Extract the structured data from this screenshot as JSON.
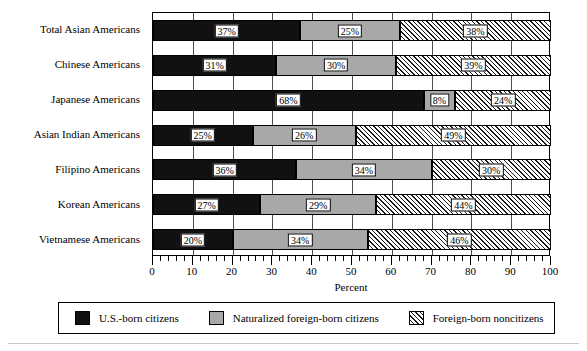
{
  "chart_data": {
    "type": "bar",
    "orientation": "horizontal",
    "stacked": true,
    "title": "",
    "xlabel": "Percent",
    "ylabel": "",
    "xlim": [
      0,
      100
    ],
    "xticks": [
      0,
      10,
      20,
      30,
      40,
      50,
      60,
      70,
      80,
      90,
      100
    ],
    "xticklabels": [
      "0",
      "10",
      "20",
      "30",
      "40",
      "50",
      "60",
      "70",
      "80",
      "90",
      "100"
    ],
    "minor_tick_interval": 2,
    "grid": "vertical",
    "legend_position": "bottom",
    "categories": [
      "Total Asian Americans",
      "Chinese Americans",
      "Japanese Americans",
      "Asian Indian Americans",
      "Filipino Americans",
      "Korean Americans",
      "Vietnamese Americans"
    ],
    "series": [
      {
        "name": "U.S.-born citizens",
        "pattern": "solid-black",
        "color": "#111111",
        "values": [
          37,
          31,
          68,
          25,
          36,
          27,
          20
        ],
        "labels": [
          "37%",
          "31%",
          "68%",
          "25%",
          "36%",
          "27%",
          "20%"
        ]
      },
      {
        "name": "Naturalized foreign-born citizens",
        "pattern": "solid-gray",
        "color": "#a8a8a8",
        "values": [
          25,
          30,
          8,
          26,
          34,
          29,
          34
        ],
        "labels": [
          "25%",
          "30%",
          "8%",
          "26%",
          "34%",
          "29%",
          "34%"
        ]
      },
      {
        "name": "Foreign-born noncitizens",
        "pattern": "diagonal-hatch",
        "color": "#ffffff",
        "values": [
          38,
          39,
          24,
          49,
          30,
          44,
          46
        ],
        "labels": [
          "38%",
          "39%",
          "24%",
          "49%",
          "30%",
          "44%",
          "46%"
        ]
      }
    ]
  },
  "axis": {
    "x_title": "Percent",
    "tick_labels": [
      "0",
      "10",
      "20",
      "30",
      "40",
      "50",
      "60",
      "70",
      "80",
      "90",
      "100"
    ],
    "category_labels": [
      "Total Asian Americans",
      "Chinese Americans",
      "Japanese Americans",
      "Asian Indian Americans",
      "Filipino Americans",
      "Korean Americans",
      "Vietnamese Americans"
    ]
  },
  "legend": {
    "items": [
      {
        "label": "U.S.-born citizens",
        "swatch": "solid-black-swatch"
      },
      {
        "label": "Naturalized foreign-born citizens",
        "swatch": "solid-gray-swatch"
      },
      {
        "label": "Foreign-born noncitizens",
        "swatch": "hatched-swatch"
      }
    ]
  },
  "bar_labels": {
    "r0": [
      "37%",
      "25%",
      "38%"
    ],
    "r1": [
      "31%",
      "30%",
      "39%"
    ],
    "r2": [
      "68%",
      "8%",
      "24%"
    ],
    "r3": [
      "25%",
      "26%",
      "49%"
    ],
    "r4": [
      "36%",
      "34%",
      "30%"
    ],
    "r5": [
      "27%",
      "29%",
      "44%"
    ],
    "r6": [
      "20%",
      "34%",
      "46%"
    ]
  }
}
